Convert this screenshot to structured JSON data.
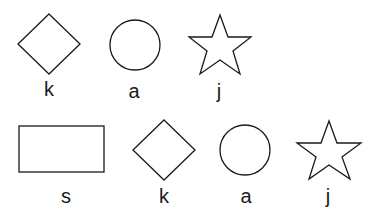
{
  "figure": {
    "rows": [
      {
        "items": [
          {
            "shape": "diamond",
            "label": "k"
          },
          {
            "shape": "circle",
            "label": "a"
          },
          {
            "shape": "star",
            "label": "j"
          }
        ]
      },
      {
        "items": [
          {
            "shape": "rectangle",
            "label": "s"
          },
          {
            "shape": "diamond",
            "label": "k"
          },
          {
            "shape": "circle",
            "label": "a"
          },
          {
            "shape": "star",
            "label": "j"
          }
        ]
      }
    ],
    "colors": {
      "stroke": "#1a1a1a",
      "background": "#ffffff"
    }
  }
}
